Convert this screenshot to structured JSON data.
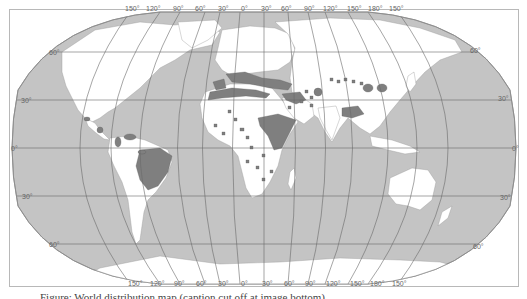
{
  "map": {
    "projection": "robinson-like",
    "colors": {
      "ocean": "#c4c4c4",
      "land": "#ffffff",
      "highlight": "#7f7f7f",
      "graticule": "#6a6a6a",
      "border": "#b0b0b0",
      "frame": "#b8b8b8"
    },
    "longitude_labels_top": [
      "150°",
      "120°",
      "90°",
      "60°",
      "30°",
      "0°",
      "30°",
      "60°",
      "90°",
      "120°",
      "150°",
      "180°",
      "150°"
    ],
    "longitude_labels_bottom": [
      "150°",
      "120°",
      "90°",
      "60°",
      "30°",
      "0°",
      "30°",
      "60°",
      "90°",
      "120°",
      "150°",
      "180°",
      "150°"
    ],
    "latitude_labels_left": [
      "60°",
      "30°",
      "0°",
      "30°",
      "60°"
    ],
    "latitude_labels_right": [
      "60°",
      "30°",
      "0°",
      "30°",
      "60°"
    ],
    "highlighted_regions": [
      "Mediterranean coast",
      "Brazil",
      "Ethiopia / Horn of Africa",
      "Tibet",
      "Iberia",
      "Anatolia / Levant",
      "Central Asia spots",
      "China spots",
      "Sahel spots",
      "Southern Africa spots",
      "Central America",
      "Northern South America"
    ]
  },
  "caption": {
    "text": "Figure: World distribution map (caption cut off at image bottom)"
  }
}
